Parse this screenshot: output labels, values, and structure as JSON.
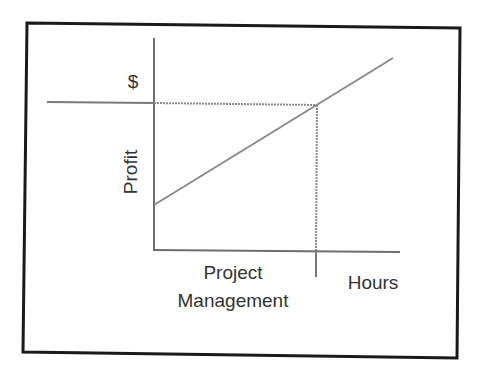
{
  "diagram": {
    "type": "line",
    "labels": {
      "y_unit": "$",
      "y_axis": "Profit",
      "x_axis_line1": "Project",
      "x_axis_line2": "Management",
      "x_unit": "Hours"
    },
    "colors": {
      "frame": "#1a1a1a",
      "axis": "#6e6e6e",
      "line": "#8a8a8a",
      "text": "#333333",
      "background": "#ffffff"
    },
    "elements": {
      "profit_line": {
        "description": "Linear increase in profit as project management hours increase",
        "starts_above_zero": true
      },
      "reference_lines": "Dotted horizontal at target $ level and dotted vertical at corresponding hours"
    }
  }
}
